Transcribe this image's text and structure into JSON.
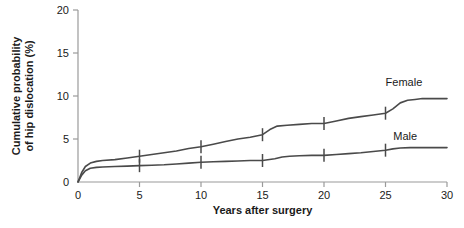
{
  "chart_data": {
    "type": "line",
    "title": "",
    "xlabel": "Years after surgery",
    "ylabel_line1": "Cumulative probability",
    "ylabel_line2": "of hip dislocation (%)",
    "xlim": [
      0,
      30
    ],
    "ylim": [
      0,
      20
    ],
    "xticks": [
      0,
      5,
      10,
      15,
      20,
      25,
      30
    ],
    "xtick_labels": [
      "0",
      "5",
      "10",
      "15",
      "20",
      "25",
      "30"
    ],
    "yticks": [
      0,
      5,
      10,
      15,
      20
    ],
    "ytick_labels": [
      "0",
      "5",
      "10",
      "15",
      "20"
    ],
    "grid": false,
    "legend_position": "inline-right",
    "line_color": "#4a4a4a",
    "axis_color": "#9a9a9a",
    "series": [
      {
        "name": "Female",
        "label": "Female",
        "label_x": 26.5,
        "label_y": 11.6,
        "ci_marks": [
          {
            "x": 5,
            "y": 3.0
          },
          {
            "x": 10,
            "y": 4.1
          },
          {
            "x": 15,
            "y": 5.5
          },
          {
            "x": 20,
            "y": 6.8
          },
          {
            "x": 25,
            "y": 8.0
          }
        ],
        "x": [
          0,
          0.3,
          0.6,
          1.0,
          1.5,
          2.0,
          3.0,
          4.0,
          5.0,
          6.0,
          7.0,
          8.0,
          9.0,
          10.0,
          11.0,
          12.0,
          13.0,
          14.0,
          15.0,
          15.6,
          16.2,
          17.0,
          18.0,
          19.0,
          20.0,
          21.0,
          22.0,
          23.0,
          24.0,
          25.0,
          25.6,
          26.2,
          26.8,
          27.4,
          28.0,
          29.0,
          30.0
        ],
        "y": [
          0.0,
          1.1,
          1.8,
          2.2,
          2.4,
          2.5,
          2.6,
          2.8,
          3.0,
          3.2,
          3.4,
          3.6,
          3.9,
          4.1,
          4.4,
          4.7,
          5.0,
          5.2,
          5.5,
          6.1,
          6.5,
          6.6,
          6.7,
          6.8,
          6.8,
          7.1,
          7.4,
          7.6,
          7.8,
          8.0,
          8.5,
          9.2,
          9.5,
          9.6,
          9.7,
          9.7,
          9.7
        ]
      },
      {
        "name": "Male",
        "label": "Male",
        "label_x": 26.6,
        "label_y": 5.3,
        "ci_marks": [
          {
            "x": 5,
            "y": 1.9
          },
          {
            "x": 10,
            "y": 2.3
          },
          {
            "x": 15,
            "y": 2.5
          },
          {
            "x": 20,
            "y": 3.1
          },
          {
            "x": 25,
            "y": 3.7
          }
        ],
        "x": [
          0,
          0.3,
          0.6,
          1.0,
          1.5,
          2.0,
          3.0,
          4.0,
          5.0,
          6.0,
          7.0,
          8.0,
          9.0,
          10.0,
          11.0,
          12.0,
          13.0,
          14.0,
          15.0,
          16.0,
          16.6,
          17.2,
          18.0,
          19.0,
          20.0,
          21.0,
          22.0,
          23.0,
          24.0,
          25.0,
          25.6,
          26.2,
          27.0,
          28.0,
          29.0,
          30.0
        ],
        "y": [
          0.0,
          0.8,
          1.3,
          1.6,
          1.7,
          1.75,
          1.8,
          1.85,
          1.9,
          1.95,
          2.0,
          2.1,
          2.2,
          2.3,
          2.35,
          2.4,
          2.45,
          2.5,
          2.5,
          2.7,
          2.9,
          3.0,
          3.05,
          3.1,
          3.1,
          3.2,
          3.3,
          3.4,
          3.55,
          3.7,
          3.85,
          3.95,
          4.0,
          4.0,
          4.0,
          4.0
        ]
      }
    ]
  }
}
